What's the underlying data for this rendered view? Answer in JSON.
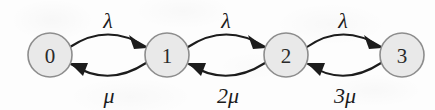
{
  "diagram": {
    "type": "state-transition-diagram",
    "background_color": "#fdfdfd",
    "node_fill_color": "#e9e9e9",
    "node_stroke_color": "#8d8d8d",
    "edge_color": "#1c1c1c",
    "nodes": [
      {
        "id": "0",
        "label": "0",
        "cx": 50,
        "cy": 55,
        "r": 22
      },
      {
        "id": "1",
        "label": "1",
        "cx": 167,
        "cy": 55,
        "r": 22
      },
      {
        "id": "2",
        "label": "2",
        "cx": 286,
        "cy": 55,
        "r": 22
      },
      {
        "id": "3",
        "label": "3",
        "cx": 402,
        "cy": 55,
        "r": 22
      }
    ],
    "edges": [
      {
        "from": "0",
        "to": "1",
        "direction": "forward",
        "label": "λ",
        "label_x": 108,
        "label_y": 26,
        "path": "M 70,47 Q 108,22 146,47",
        "arrow_points": "146,47 131,36 135,48"
      },
      {
        "from": "1",
        "to": "0",
        "direction": "backward",
        "label": "μ",
        "label_coef": "",
        "label_symbol": "μ",
        "label_x": 108,
        "label_y": 100,
        "path": "M 146,63 Q 108,88 71,64",
        "arrow_points": "71,64 86,64 83,75"
      },
      {
        "from": "1",
        "to": "2",
        "direction": "forward",
        "label": "λ",
        "label_x": 226,
        "label_y": 26,
        "path": "M 188,47 Q 226,22 265,47",
        "arrow_points": "265,47 250,36 254,48"
      },
      {
        "from": "2",
        "to": "1",
        "direction": "backward",
        "label": "2μ",
        "label_coef": "2",
        "label_symbol": "μ",
        "label_x": 228,
        "label_y": 100,
        "path": "M 265,63 Q 226,88 189,64",
        "arrow_points": "189,64 204,64 201,75"
      },
      {
        "from": "2",
        "to": "3",
        "direction": "forward",
        "label": "λ",
        "label_x": 343,
        "label_y": 26,
        "path": "M 307,47 Q 343,22 381,47",
        "arrow_points": "381,47 366,36 370,48"
      },
      {
        "from": "3",
        "to": "2",
        "direction": "backward",
        "label": "3μ",
        "label_coef": "3",
        "label_symbol": "μ",
        "label_x": 345,
        "label_y": 100,
        "path": "M 381,63 Q 343,88 308,64",
        "arrow_points": "308,64 323,64 320,75"
      }
    ],
    "rate_labels_top": [
      "λ",
      "λ",
      "λ"
    ],
    "rate_labels_bottom": [
      "μ",
      "2μ",
      "3μ"
    ]
  }
}
